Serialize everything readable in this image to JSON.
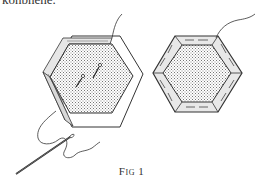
{
  "page": {
    "top_text_fragment": "konbnene.",
    "caption": "Fig 1"
  },
  "figure": {
    "items": [
      {
        "name": "pinned-hexagon",
        "detail": "fabric folded over paper template, two pins, thread leading to needle"
      },
      {
        "name": "tacked-hexagon",
        "detail": "fabric tacked around all six edges, thread tail at top right"
      }
    ],
    "colors": {
      "ink": "#333333",
      "shade": "#9a9a9a",
      "paper": "#ffffff"
    }
  }
}
